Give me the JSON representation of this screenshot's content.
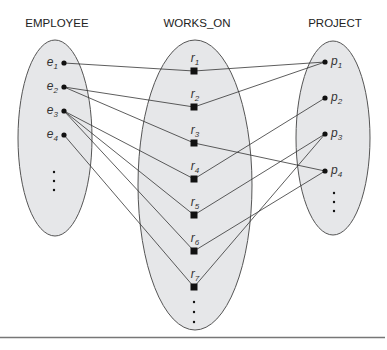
{
  "diagram": {
    "type": "relationship-instance",
    "sets": {
      "employee": {
        "title": "EMPLOYEE",
        "cx": 55,
        "cy": 138,
        "rx": 37,
        "ry": 98
      },
      "works_on": {
        "title": "WORKS_ON",
        "cx": 195,
        "cy": 185,
        "rx": 57,
        "ry": 145
      },
      "project": {
        "title": "PROJECT",
        "cx": 333,
        "cy": 138,
        "rx": 37,
        "ry": 97
      }
    },
    "employees": [
      {
        "id": "e1",
        "base": "e",
        "sub": "1",
        "x": 64,
        "y": 63
      },
      {
        "id": "e2",
        "base": "e",
        "sub": "2",
        "x": 64,
        "y": 87
      },
      {
        "id": "e3",
        "base": "e",
        "sub": "3",
        "x": 64,
        "y": 111
      },
      {
        "id": "e4",
        "base": "e",
        "sub": "4",
        "x": 64,
        "y": 135
      }
    ],
    "relationships": [
      {
        "id": "r1",
        "base": "r",
        "sub": "1",
        "x": 194,
        "y": 71
      },
      {
        "id": "r2",
        "base": "r",
        "sub": "2",
        "x": 194,
        "y": 107
      },
      {
        "id": "r3",
        "base": "r",
        "sub": "3",
        "x": 194,
        "y": 143
      },
      {
        "id": "r4",
        "base": "r",
        "sub": "4",
        "x": 194,
        "y": 179
      },
      {
        "id": "r5",
        "base": "r",
        "sub": "5",
        "x": 194,
        "y": 215
      },
      {
        "id": "r6",
        "base": "r",
        "sub": "6",
        "x": 194,
        "y": 251
      },
      {
        "id": "r7",
        "base": "r",
        "sub": "7",
        "x": 194,
        "y": 287
      }
    ],
    "projects": [
      {
        "id": "p1",
        "base": "p",
        "sub": "1",
        "x": 325,
        "y": 62
      },
      {
        "id": "p2",
        "base": "p",
        "sub": "2",
        "x": 325,
        "y": 98
      },
      {
        "id": "p3",
        "base": "p",
        "sub": "3",
        "x": 325,
        "y": 134
      },
      {
        "id": "p4",
        "base": "p",
        "sub": "4",
        "x": 325,
        "y": 171
      }
    ],
    "links": [
      {
        "r": "r1",
        "e": "e1",
        "p": "p1"
      },
      {
        "r": "r2",
        "e": "e2",
        "p": "p1"
      },
      {
        "r": "r3",
        "e": "e2",
        "p": "p4"
      },
      {
        "r": "r4",
        "e": "e3",
        "p": "p2"
      },
      {
        "r": "r5",
        "e": "e3",
        "p": "p3"
      },
      {
        "r": "r6",
        "e": "e3",
        "p": "p4"
      },
      {
        "r": "r7",
        "e": "e4",
        "p": "p3"
      }
    ],
    "ellipsis": "⋮",
    "colors": {
      "fill": "#e6e7e9",
      "stroke": "#555555",
      "line": "#333333",
      "point": "#111111"
    }
  }
}
